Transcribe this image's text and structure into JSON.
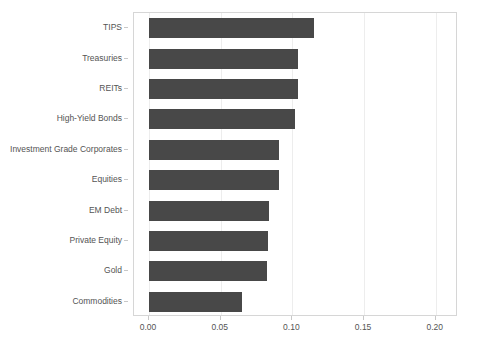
{
  "chart_data": {
    "type": "bar",
    "orientation": "horizontal",
    "title": "",
    "subtitle": "",
    "xlabel": "",
    "ylabel": "",
    "categories": [
      "TIPS",
      "Treasuries",
      "REITs",
      "High-Yield Bonds",
      "Investment Grade Corporates",
      "Equities",
      "EM Debt",
      "Private Equity",
      "Gold",
      "Commodities"
    ],
    "values": [
      0.115,
      0.104,
      0.104,
      0.102,
      0.091,
      0.091,
      0.084,
      0.083,
      0.082,
      0.065
    ],
    "xlim": [
      0.0,
      0.2155
    ],
    "xticks": [
      0.0,
      0.05,
      0.1,
      0.15,
      0.2
    ],
    "xticklabels": [
      "0.00",
      "0.05",
      "0.10",
      "0.15",
      "0.20"
    ],
    "grid": "vertical-only",
    "legend": "none",
    "bar_color": "#484848",
    "grid_color": "#ededed",
    "axis_color": "#d6d6d6",
    "tick_label_color": "#545454"
  }
}
